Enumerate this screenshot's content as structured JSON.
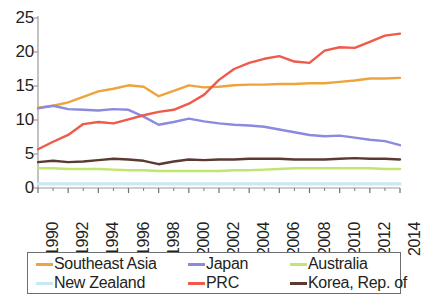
{
  "chart_data": {
    "type": "line",
    "title": "",
    "subtitle": "",
    "xlabel": "",
    "ylabel": "",
    "xlim": [
      1990,
      2014
    ],
    "ylim": [
      0,
      25
    ],
    "grid": false,
    "legend_position": "bottom",
    "x": [
      1990,
      1991,
      1992,
      1993,
      1994,
      1995,
      1996,
      1997,
      1998,
      1999,
      2000,
      2001,
      2002,
      2003,
      2004,
      2005,
      2006,
      2007,
      2008,
      2009,
      2010,
      2011,
      2012,
      2013,
      2014
    ],
    "xticks": [
      "1990",
      "1992",
      "1994",
      "1996",
      "1998",
      "2000",
      "2002",
      "2004",
      "2006",
      "2008",
      "2010",
      "2012",
      "2014"
    ],
    "yticks": [
      "0",
      "5",
      "10",
      "15",
      "20",
      "25"
    ],
    "series": [
      {
        "name": "Southeast Asia",
        "color": "#efa33c",
        "values": [
          11.8,
          12.1,
          12.6,
          13.4,
          14.2,
          14.6,
          15.1,
          14.9,
          13.5,
          14.3,
          15.1,
          14.8,
          14.9,
          15.1,
          15.2,
          15.2,
          15.3,
          15.3,
          15.4,
          15.4,
          15.6,
          15.8,
          16.1,
          16.1,
          16.2
        ]
      },
      {
        "name": "Japan",
        "color": "#8b8ade",
        "values": [
          11.7,
          12.1,
          11.6,
          11.5,
          11.4,
          11.6,
          11.5,
          10.5,
          9.3,
          9.7,
          10.2,
          9.8,
          9.5,
          9.3,
          9.2,
          9.0,
          8.6,
          8.2,
          7.8,
          7.6,
          7.7,
          7.4,
          7.1,
          6.9,
          6.3
        ]
      },
      {
        "name": "Australia",
        "color": "#c1e56e",
        "values": [
          2.9,
          2.9,
          2.8,
          2.8,
          2.8,
          2.7,
          2.6,
          2.6,
          2.5,
          2.5,
          2.5,
          2.5,
          2.5,
          2.6,
          2.6,
          2.7,
          2.8,
          2.9,
          2.9,
          2.9,
          2.9,
          2.9,
          2.9,
          2.8,
          2.8
        ]
      },
      {
        "name": "New Zealand",
        "color": "#c9e9f2",
        "values": [
          0.6,
          0.6,
          0.6,
          0.6,
          0.6,
          0.6,
          0.6,
          0.6,
          0.6,
          0.6,
          0.6,
          0.6,
          0.6,
          0.6,
          0.6,
          0.6,
          0.6,
          0.6,
          0.6,
          0.6,
          0.6,
          0.6,
          0.6,
          0.6,
          0.6
        ]
      },
      {
        "name": "PRC",
        "color": "#ef5a4a",
        "values": [
          5.7,
          6.8,
          7.8,
          9.4,
          9.7,
          9.5,
          10.1,
          10.7,
          11.2,
          11.5,
          12.4,
          13.7,
          15.9,
          17.5,
          18.4,
          19.0,
          19.4,
          18.6,
          18.4,
          20.2,
          20.7,
          20.6,
          21.5,
          22.4,
          22.7
        ]
      },
      {
        "name": "Korea, Rep. of",
        "color": "#5c3a32",
        "values": [
          3.8,
          4.0,
          3.8,
          3.9,
          4.1,
          4.3,
          4.2,
          4.0,
          3.5,
          3.9,
          4.2,
          4.1,
          4.2,
          4.2,
          4.3,
          4.3,
          4.3,
          4.2,
          4.2,
          4.2,
          4.3,
          4.4,
          4.3,
          4.3,
          4.2
        ]
      }
    ]
  },
  "axes": {
    "y_ticks": [
      "25",
      "20",
      "15",
      "10",
      "5",
      "0"
    ],
    "x_ticks": [
      "1990",
      "1992",
      "1994",
      "1996",
      "1998",
      "2000",
      "2002",
      "2004",
      "2006",
      "2008",
      "2010",
      "2012",
      "2014"
    ]
  },
  "legend": {
    "row1": [
      {
        "label": "Southeast Asia",
        "color": "#efa33c"
      },
      {
        "label": "Japan",
        "color": "#8b8ade"
      },
      {
        "label": "Australia",
        "color": "#c1e56e"
      }
    ],
    "row2": [
      {
        "label": "New Zealand",
        "color": "#c9e9f2"
      },
      {
        "label": "PRC",
        "color": "#ef5a4a"
      },
      {
        "label": "Korea, Rep. of",
        "color": "#5c3a32"
      }
    ]
  }
}
